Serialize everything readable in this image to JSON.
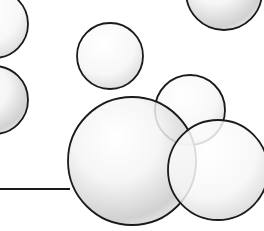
{
  "scene": {
    "description": "Illustration of overlapping soap bubbles with dark outlines and soft gray shading",
    "background": "#ffffff",
    "outline_color": "#1a1a1a",
    "shade_color": "#b8b8b8",
    "bubbles": [
      {
        "id": "bubble-top-left",
        "cx": -6,
        "cy": 24,
        "r": 34
      },
      {
        "id": "bubble-mid-left",
        "cx": -6,
        "cy": 100,
        "r": 34
      },
      {
        "id": "bubble-small-center",
        "cx": 110,
        "cy": 56,
        "r": 33
      },
      {
        "id": "bubble-top-right",
        "cx": 224,
        "cy": -8,
        "r": 38
      },
      {
        "id": "bubble-back-right",
        "cx": 190,
        "cy": 110,
        "r": 35
      },
      {
        "id": "bubble-large",
        "cx": 132,
        "cy": 161,
        "r": 64
      },
      {
        "id": "bubble-bottom-right",
        "cx": 218,
        "cy": 170,
        "r": 50
      }
    ],
    "line": {
      "x1": 0,
      "y1": 189,
      "x2": 70,
      "y2": 189
    }
  }
}
